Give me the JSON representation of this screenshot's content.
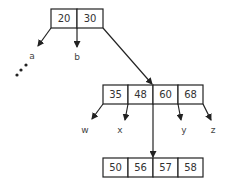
{
  "diagram": {
    "type": "b-tree",
    "root": {
      "keys": [
        "20",
        "30"
      ]
    },
    "middle": {
      "keys": [
        "35",
        "48",
        "60",
        "68"
      ]
    },
    "bottom": {
      "keys": [
        "50",
        "56",
        "57",
        "58"
      ]
    },
    "subtree_labels": {
      "a": "a",
      "b": "b",
      "w": "w",
      "x": "x",
      "y": "y",
      "z": "z"
    },
    "ellipsis": "..."
  }
}
